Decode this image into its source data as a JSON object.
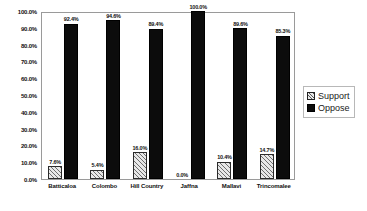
{
  "chart_data": {
    "type": "bar",
    "title": "",
    "subtitle": "",
    "xlabel": "",
    "ylabel": "",
    "ylim": [
      0,
      100
    ],
    "grid": false,
    "legend_position": "right",
    "categories": [
      "Batticaloa",
      "Colombo",
      "Hill Country",
      "Jaffna",
      "Mallavi",
      "Trincomalee"
    ],
    "ytick_labels": [
      "0.0%",
      "10.0%",
      "20.0%",
      "30.0%",
      "40.0%",
      "50.0%",
      "60.0%",
      "70.0%",
      "80.0%",
      "90.0%",
      "100.0%"
    ],
    "ytick_values": [
      0,
      10,
      20,
      30,
      40,
      50,
      60,
      70,
      80,
      90,
      100
    ],
    "series": [
      {
        "name": "Support",
        "color": "#e8e8e8",
        "pattern": "diagonal-hatch",
        "values": [
          7.6,
          5.4,
          16.0,
          0.0,
          10.4,
          14.7
        ],
        "data_labels": [
          "7.6%",
          "5.4%",
          "16.0%",
          "0.0%",
          "10.4%",
          "14.7%"
        ]
      },
      {
        "name": "Oppose",
        "color": "#0c0c0c",
        "pattern": "solid",
        "values": [
          92.4,
          94.6,
          89.4,
          100.0,
          89.6,
          85.3
        ],
        "data_labels": [
          "92.4%",
          "94.6%",
          "89.4%",
          "100.0%",
          "89.6%",
          "85.3%"
        ]
      }
    ]
  },
  "legend": {
    "items": [
      {
        "label": "Support"
      },
      {
        "label": "Oppose"
      }
    ]
  }
}
